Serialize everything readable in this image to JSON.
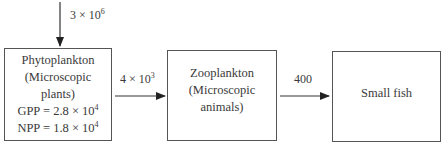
{
  "diagram": {
    "title": "",
    "input": {
      "label_base": "3 × 10",
      "label_exp": "6"
    },
    "nodes": [
      {
        "id": "phytoplankton",
        "lines": [
          "Phytoplankton",
          "(Microscopic",
          "plants)"
        ],
        "gpp": {
          "prefix": "GPP = 2.8 × 10",
          "exp": "4"
        },
        "npp": {
          "prefix": "NPP = 1.8 × 10",
          "exp": "4"
        }
      },
      {
        "id": "zooplankton",
        "lines": [
          "Zooplankton",
          "(Microscopic",
          "animals)"
        ]
      },
      {
        "id": "small-fish",
        "lines": [
          "Small fish"
        ]
      }
    ],
    "edges": [
      {
        "from": "phytoplankton",
        "to": "zooplankton",
        "label_base": "4 × 10",
        "label_exp": "3"
      },
      {
        "from": "zooplankton",
        "to": "small-fish",
        "label": "400"
      }
    ]
  }
}
